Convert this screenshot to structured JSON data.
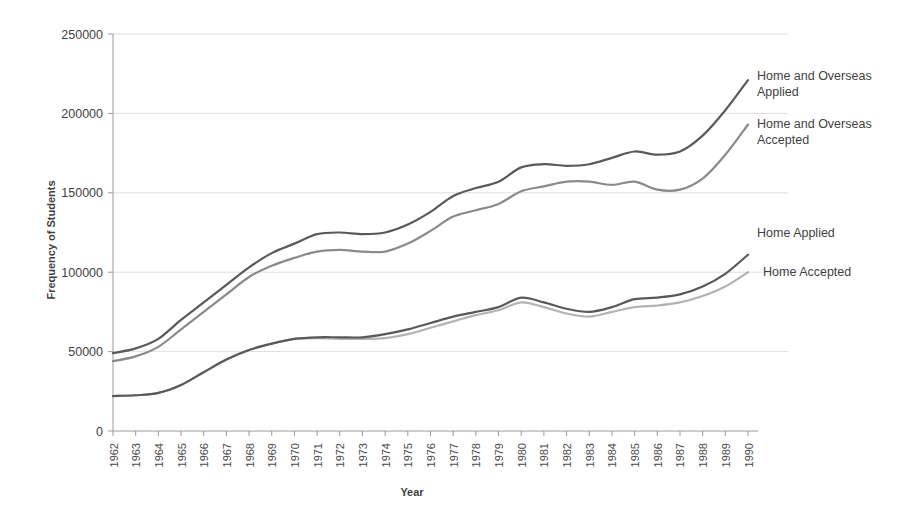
{
  "chart_data": {
    "type": "line",
    "title": "",
    "xlabel": "Year",
    "ylabel": "Frequency of Students",
    "ylim": [
      0,
      250000
    ],
    "ytick_labels": [
      "0",
      "50000",
      "100000",
      "150000",
      "200000",
      "250000"
    ],
    "yticks": [
      0,
      50000,
      100000,
      150000,
      200000,
      250000
    ],
    "grid": true,
    "legend_position": "right-inline-labels",
    "x": [
      1962,
      1963,
      1964,
      1965,
      1966,
      1967,
      1968,
      1969,
      1970,
      1971,
      1972,
      1973,
      1974,
      1975,
      1976,
      1977,
      1978,
      1979,
      1980,
      1981,
      1982,
      1983,
      1984,
      1985,
      1986,
      1987,
      1988,
      1989,
      1990
    ],
    "categories": [
      "1962",
      "1963",
      "1964",
      "1965",
      "1966",
      "1967",
      "1968",
      "1969",
      "1970",
      "1971",
      "1972",
      "1973",
      "1974",
      "1975",
      "1976",
      "1977",
      "1978",
      "1979",
      "1980",
      "1981",
      "1982",
      "1983",
      "1984",
      "1985",
      "1986",
      "1987",
      "1988",
      "1989",
      "1990"
    ],
    "series": [
      {
        "name": "Home and Overseas Applied",
        "color": "#595959",
        "values": [
          49000,
          52000,
          58000,
          70000,
          81000,
          92000,
          103000,
          112000,
          118000,
          124000,
          125000,
          124000,
          125000,
          130000,
          138000,
          148000,
          153000,
          157000,
          166000,
          168000,
          167000,
          168000,
          172000,
          176000,
          174000,
          176000,
          186000,
          202000,
          221000
        ]
      },
      {
        "name": "Home and Overseas Accepted",
        "color": "#8a8a8a",
        "values": [
          44000,
          47000,
          53000,
          64000,
          75000,
          86000,
          97000,
          104000,
          109000,
          113000,
          114000,
          113000,
          113000,
          118000,
          126000,
          135000,
          139000,
          143000,
          151000,
          154000,
          157000,
          157000,
          155000,
          157000,
          152000,
          152000,
          159000,
          174000,
          193000
        ]
      },
      {
        "name": "Home Applied",
        "color": "#595959",
        "values": [
          22000,
          22500,
          24000,
          29000,
          37000,
          45000,
          51000,
          55000,
          58000,
          59000,
          59000,
          59000,
          61000,
          64000,
          68000,
          72000,
          75000,
          78000,
          84000,
          81000,
          77000,
          75000,
          78000,
          83000,
          84000,
          86000,
          91000,
          99000,
          111000
        ]
      },
      {
        "name": "Home Accepted",
        "color": "#b3b3b3",
        "values": [
          22000,
          22500,
          24000,
          29000,
          37000,
          45000,
          51000,
          55000,
          58000,
          58500,
          58000,
          58000,
          58500,
          61000,
          65000,
          69000,
          73000,
          76000,
          81000,
          78000,
          74000,
          72000,
          75000,
          78000,
          79000,
          81000,
          85000,
          91000,
          100000
        ]
      }
    ],
    "series_labels": [
      {
        "text_line1": "Home and Overseas",
        "text_line2": "Applied"
      },
      {
        "text_line1": "Home and Overseas",
        "text_line2": "Accepted"
      },
      {
        "text_line1": "Home Applied",
        "text_line2": ""
      },
      {
        "text_line1": "Home Accepted",
        "text_line2": ""
      }
    ]
  }
}
